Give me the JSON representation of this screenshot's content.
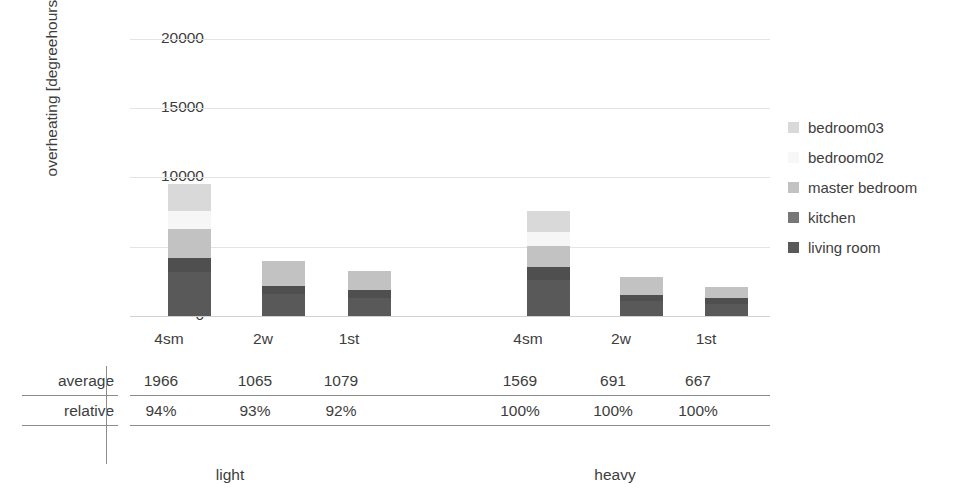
{
  "chart_data": {
    "type": "bar",
    "subtype": "stacked",
    "title": "",
    "xlabel": "",
    "ylabel": "overheating [degreehours]",
    "ylim": [
      0,
      20000
    ],
    "yticks": [
      0,
      5000,
      10000,
      15000,
      20000
    ],
    "ytick_labels": [
      "0",
      "5000",
      "10000",
      "15000",
      "20000"
    ],
    "grid": true,
    "legend_position": "right",
    "categories": [
      "4sm",
      "2w",
      "1st",
      "4sm",
      "2w",
      "1st"
    ],
    "groups": [
      {
        "label": "light",
        "categories": [
          "4sm",
          "2w",
          "1st"
        ]
      },
      {
        "label": "heavy",
        "categories": [
          "4sm",
          "2w",
          "1st"
        ]
      }
    ],
    "series": [
      {
        "name": "living room",
        "color": "#595959",
        "values": [
          3150,
          1600,
          1300,
          2600,
          1050,
          900
        ]
      },
      {
        "name": "kitchen",
        "color": "#4f4f4f",
        "values": [
          1050,
          600,
          550,
          950,
          450,
          400
        ]
      },
      {
        "name": "master bedroom",
        "color": "#c2c2c2",
        "values": [
          2100,
          1750,
          1400,
          1500,
          1300,
          800
        ]
      },
      {
        "name": "bedroom02",
        "color": "#f6f6f6",
        "values": [
          1300,
          0,
          0,
          1000,
          0,
          0
        ]
      },
      {
        "name": "bedroom03",
        "color": "#d9d9d9",
        "values": [
          1950,
          0,
          0,
          1550,
          0,
          0
        ]
      }
    ],
    "totals": [
      9550,
      3950,
      3250,
      7600,
      2800,
      2100
    ],
    "annotations": {
      "table_rows": [
        {
          "label": "average",
          "values": [
            "1966",
            "1065",
            "1079",
            "1569",
            "691",
            "667"
          ]
        },
        {
          "label": "relative",
          "values": [
            "94%",
            "93%",
            "92%",
            "100%",
            "100%",
            "100%"
          ]
        }
      ]
    }
  },
  "legend": {
    "items": [
      {
        "label": "bedroom03",
        "color": "#d9d9d9"
      },
      {
        "label": "bedroom02",
        "color": "#f7f7f7"
      },
      {
        "label": "master bedroom",
        "color": "#c2c2c2"
      },
      {
        "label": "kitchen",
        "color": "#777777"
      },
      {
        "label": "living room",
        "color": "#595959"
      }
    ]
  },
  "axis": {
    "y_title": "overheating [degreehours]",
    "y_tick_0": "0",
    "y_tick_1": "5000",
    "y_tick_2": "10000",
    "y_tick_3": "15000",
    "y_tick_4": "20000"
  },
  "xaxis": {
    "ticks": [
      "4sm",
      "2w",
      "1st",
      "4sm",
      "2w",
      "1st"
    ]
  },
  "table": {
    "row_average_label": "average",
    "row_relative_label": "relative",
    "average": [
      "1966",
      "1065",
      "1079",
      "1569",
      "691",
      "667"
    ],
    "relative": [
      "94%",
      "93%",
      "92%",
      "100%",
      "100%",
      "100%"
    ]
  },
  "groups": {
    "light": "light",
    "heavy": "heavy"
  }
}
